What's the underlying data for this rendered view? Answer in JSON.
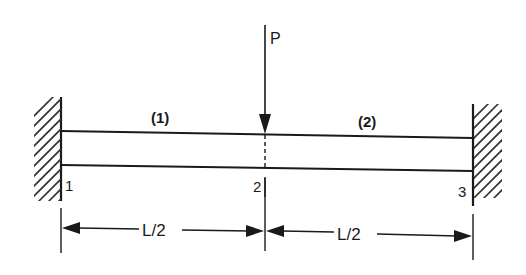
{
  "diagram": {
    "type": "fixed-fixed beam with central point load",
    "load": {
      "label": "P",
      "direction": "down",
      "at_node": "2"
    },
    "elements": [
      {
        "label": "(1)",
        "from_node": "1",
        "to_node": "2"
      },
      {
        "label": "(2)",
        "from_node": "2",
        "to_node": "3"
      }
    ],
    "nodes": [
      {
        "label": "1",
        "support": "fixed wall (left)"
      },
      {
        "label": "2",
        "support": "none"
      },
      {
        "label": "3",
        "support": "fixed wall (right)"
      }
    ],
    "dimensions": [
      {
        "label": "L/2",
        "from_node": "1",
        "to_node": "2"
      },
      {
        "label": "L/2",
        "from_node": "2",
        "to_node": "3"
      }
    ]
  },
  "colors": {
    "ink": "#1a1a1a",
    "background": "#ffffff"
  }
}
